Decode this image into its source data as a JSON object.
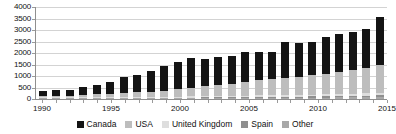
{
  "chart_data": {
    "type": "bar",
    "stacked": true,
    "title": "",
    "subtitle": "",
    "xlabel": "",
    "ylabel": "",
    "grid": true,
    "legend_position": "bottom",
    "ylim": [
      0,
      4000
    ],
    "y_ticks": [
      0,
      500,
      1000,
      1500,
      2000,
      2500,
      3000,
      3500,
      4000
    ],
    "x_tick_labels": [
      "1990",
      "1995",
      "2000",
      "2005",
      "2010",
      "2015"
    ],
    "x_label_years": [
      1990,
      1995,
      2000,
      2005,
      2010,
      2015
    ],
    "categories": [
      "1990",
      "1991",
      "1992",
      "1993",
      "1994",
      "1995",
      "1996",
      "1997",
      "1998",
      "1999",
      "2000",
      "2001",
      "2002",
      "2003",
      "2004",
      "2005",
      "2006",
      "2007",
      "2008",
      "2009",
      "2010",
      "2011",
      "2012",
      "2013",
      "2014",
      "2015"
    ],
    "series": [
      {
        "name": "Canada",
        "color": "#141414",
        "values": [
          200,
          230,
          240,
          330,
          390,
          510,
          680,
          760,
          900,
          1060,
          1160,
          1290,
          1200,
          1230,
          1200,
          1280,
          1250,
          1200,
          1550,
          1480,
          1430,
          1580,
          1640,
          1690,
          1730,
          2050
        ]
      },
      {
        "name": "USA",
        "color": "#bdbdbd",
        "values": [
          60,
          65,
          70,
          110,
          130,
          160,
          190,
          210,
          240,
          270,
          330,
          380,
          430,
          480,
          540,
          610,
          660,
          700,
          740,
          790,
          840,
          900,
          960,
          1010,
          1080,
          1220
        ]
      },
      {
        "name": "United Kingdom",
        "color": "#dedede",
        "values": [
          12,
          13,
          14,
          18,
          20,
          24,
          28,
          30,
          34,
          38,
          44,
          48,
          52,
          56,
          60,
          64,
          68,
          72,
          76,
          80,
          84,
          90,
          96,
          100,
          106,
          120
        ]
      },
      {
        "name": "Spain",
        "color": "#8f8f8f",
        "values": [
          8,
          9,
          10,
          12,
          14,
          16,
          18,
          20,
          22,
          24,
          28,
          30,
          32,
          34,
          36,
          40,
          42,
          44,
          46,
          48,
          52,
          56,
          60,
          62,
          66,
          74
        ]
      },
      {
        "name": "Other",
        "color": "#a8a8a8",
        "values": [
          8,
          9,
          10,
          12,
          14,
          16,
          18,
          20,
          22,
          26,
          30,
          32,
          34,
          36,
          40,
          44,
          46,
          48,
          52,
          56,
          60,
          64,
          68,
          72,
          78,
          88
        ]
      }
    ],
    "totals": [
      288,
      326,
      344,
      482,
      568,
      726,
      934,
      1040,
      1218,
      1418,
      1592,
      1780,
      1748,
      1836,
      1876,
      2038,
      2066,
      2064,
      2464,
      2454,
      2466,
      2690,
      2824,
      2934,
      3060,
      3552
    ]
  },
  "axis": {
    "y_tick_labels": [
      "4000",
      "3500",
      "3000",
      "2500",
      "2000",
      "1500",
      "1000",
      "500",
      "0"
    ]
  },
  "legend": {
    "items": [
      {
        "label": "Canada",
        "color": "#141414"
      },
      {
        "label": "USA",
        "color": "#bdbdbd"
      },
      {
        "label": "United Kingdom",
        "color": "#dedede"
      },
      {
        "label": "Spain",
        "color": "#8f8f8f"
      },
      {
        "label": "Other",
        "color": "#a8a8a8"
      }
    ]
  }
}
